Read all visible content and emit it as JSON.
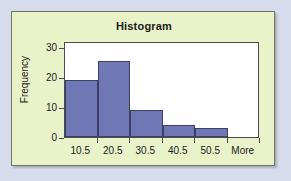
{
  "colors": {
    "page_background": "#d7dcec",
    "chart_background": "#eaf2c9",
    "plot_background": "#ffffff",
    "bar_fill": "#6f77b4",
    "bar_border": "#3a3f63",
    "axis": "#4c4c4c",
    "text": "#1b1b1b"
  },
  "chart_data": {
    "type": "bar",
    "title": "Histogram",
    "xlabel": "",
    "ylabel": "Frequency",
    "categories": [
      "10.5",
      "20.5",
      "30.5",
      "40.5",
      "50.5",
      "More"
    ],
    "values": [
      19,
      25.5,
      9,
      4,
      3,
      0
    ],
    "ylim": [
      0,
      32
    ],
    "yticks": [
      0,
      10,
      20,
      30
    ],
    "ytick_labels": [
      "0",
      "10",
      "20",
      "30"
    ],
    "grid": false,
    "legend": false,
    "legend_position": "none",
    "bar_gap": 0
  }
}
